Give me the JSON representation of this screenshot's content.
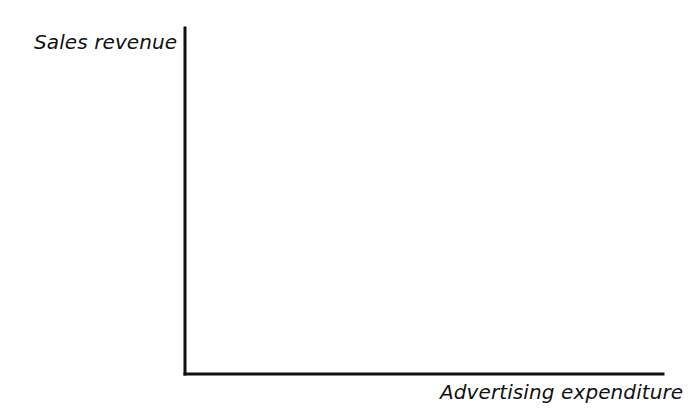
{
  "chart_data": {
    "type": "scatter",
    "title": "",
    "xlabel": "Advertising expenditure",
    "ylabel": "Sales revenue",
    "marker": "x-cross",
    "marker_color": "#111111",
    "axis_color": "#111111",
    "grid": false,
    "legend": null,
    "xlim": [
      0,
      10
    ],
    "ylim": [
      0,
      10
    ],
    "x_tick_labels": [],
    "y_tick_labels": [],
    "points": [
      {
        "label": "point-1",
        "x": 2.68,
        "y": 5.52,
        "px": 313,
        "py": 183
      },
      {
        "label": "point-2",
        "x": 2.74,
        "y": 2.28,
        "px": 316,
        "py": 295
      },
      {
        "label": "point-3",
        "x": 4.33,
        "y": 4.75,
        "px": 392,
        "py": 210
      },
      {
        "label": "point-4",
        "x": 5.84,
        "y": 7.43,
        "px": 464,
        "py": 117
      },
      {
        "label": "point-5",
        "x": 7.41,
        "y": 6.62,
        "px": 539,
        "py": 145
      },
      {
        "label": "point-6",
        "x": 8.77,
        "y": 9.51,
        "px": 604,
        "py": 45
      },
      {
        "label": "point-7",
        "x": 9.62,
        "y": 7.98,
        "px": 645,
        "py": 98
      }
    ],
    "axes_geometry": {
      "origin_px": [
        185,
        374
      ],
      "y_axis_top_px": [
        185,
        28
      ],
      "x_axis_right_px": [
        663,
        374
      ],
      "axis_stroke_width": 3,
      "marker_size": 17,
      "marker_stroke_width": 3.4
    }
  }
}
